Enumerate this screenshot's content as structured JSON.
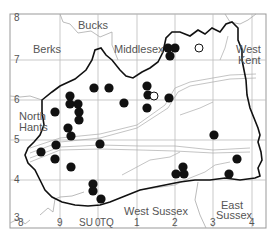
{
  "map": {
    "type": "distribution-map",
    "frame": {
      "x": 10,
      "y": 14,
      "w": 256,
      "h": 214
    },
    "county_labels": [
      {
        "text": "Bucks",
        "x": 78,
        "y": 20
      },
      {
        "text": "Berks",
        "x": 33,
        "y": 44
      },
      {
        "text": "Middlesex",
        "x": 114,
        "y": 44
      },
      {
        "text": "West",
        "x": 236,
        "y": 44
      },
      {
        "text": "Kent",
        "x": 238,
        "y": 55
      },
      {
        "text": "North",
        "x": 19,
        "y": 111
      },
      {
        "text": "Hants",
        "x": 19,
        "y": 122
      },
      {
        "text": "West Sussex",
        "x": 124,
        "y": 206
      },
      {
        "text": "East",
        "x": 221,
        "y": 200
      },
      {
        "text": "Sussex",
        "x": 216,
        "y": 210
      }
    ],
    "y_ticks": [
      {
        "text": "8",
        "y": 18
      },
      {
        "text": "7",
        "y": 60
      },
      {
        "text": "6",
        "y": 100
      },
      {
        "text": "5",
        "y": 140
      },
      {
        "text": "4",
        "y": 180
      },
      {
        "text": "3",
        "y": 218
      }
    ],
    "x_ticks": [
      {
        "text": "8",
        "x": 21
      },
      {
        "text": "9",
        "x": 60
      },
      {
        "text": "SU",
        "x": 82
      },
      {
        "text": "0",
        "x": 98
      },
      {
        "text": "TQ",
        "x": 103
      },
      {
        "text": "1",
        "x": 137
      },
      {
        "text": "2",
        "x": 175
      },
      {
        "text": "3",
        "x": 213
      },
      {
        "text": "4",
        "x": 252
      }
    ],
    "grid_x": [
      60,
      98,
      137,
      175,
      213,
      252
    ],
    "grid_y": [
      60,
      100,
      140,
      180
    ],
    "filled_records": [
      [
        94,
        88
      ],
      [
        109,
        88
      ],
      [
        70,
        96
      ],
      [
        70,
        104
      ],
      [
        78,
        104
      ],
      [
        79,
        112
      ],
      [
        79,
        120
      ],
      [
        55,
        112
      ],
      [
        124,
        103
      ],
      [
        68,
        128
      ],
      [
        56,
        145
      ],
      [
        41,
        152
      ],
      [
        71,
        136
      ],
      [
        100,
        144
      ],
      [
        55,
        159
      ],
      [
        71,
        167
      ],
      [
        93,
        184
      ],
      [
        93,
        191
      ],
      [
        101,
        199
      ],
      [
        168,
        48
      ],
      [
        175,
        48
      ],
      [
        170,
        56
      ],
      [
        147,
        86
      ],
      [
        148,
        95
      ],
      [
        169,
        98
      ],
      [
        147,
        108
      ],
      [
        214,
        135
      ],
      [
        237,
        159
      ],
      [
        176,
        174
      ],
      [
        183,
        167
      ],
      [
        184,
        174
      ],
      [
        229,
        174
      ]
    ],
    "open_records": [
      [
        199,
        48
      ],
      [
        154,
        96
      ]
    ],
    "colors": {
      "dot": "#111111",
      "boundary": "#111111",
      "grid": "#bbbbbb",
      "thin": "#999999"
    }
  }
}
